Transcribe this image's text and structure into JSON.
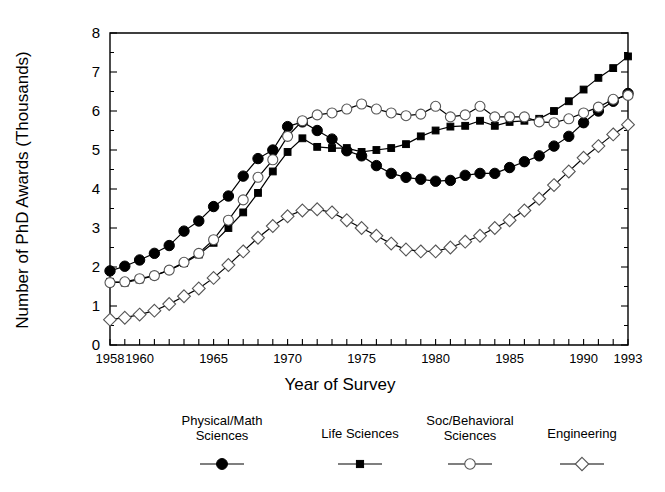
{
  "chart_data": {
    "type": "line",
    "title": "",
    "xlabel": "Year of Survey",
    "ylabel": "Number of PhD Awards (Thousands)",
    "xlim": [
      1958,
      1993
    ],
    "ylim": [
      0,
      8
    ],
    "ytick_labels": [
      "0",
      "1",
      "2",
      "3",
      "4",
      "5",
      "6",
      "7",
      "8"
    ],
    "ytick_values": [
      0,
      1,
      2,
      3,
      4,
      5,
      6,
      7,
      8
    ],
    "xtick_labels": [
      "1958",
      "1960",
      "1965",
      "1970",
      "1975",
      "1980",
      "1985",
      "1990",
      "1993"
    ],
    "xtick_values": [
      1958,
      1960,
      1965,
      1970,
      1975,
      1980,
      1985,
      1990,
      1993
    ],
    "grid": false,
    "legend_position": "bottom",
    "x": [
      1958,
      1959,
      1960,
      1961,
      1962,
      1963,
      1964,
      1965,
      1966,
      1967,
      1968,
      1969,
      1970,
      1971,
      1972,
      1973,
      1974,
      1975,
      1976,
      1977,
      1978,
      1979,
      1980,
      1981,
      1982,
      1983,
      1984,
      1985,
      1986,
      1987,
      1988,
      1989,
      1990,
      1991,
      1992,
      1993
    ],
    "series": [
      {
        "name": "Physical/Math Sciences",
        "marker": "filled-circle",
        "values": [
          1.9,
          2.02,
          2.18,
          2.35,
          2.55,
          2.92,
          3.18,
          3.55,
          3.82,
          4.33,
          4.78,
          5.0,
          5.6,
          5.72,
          5.5,
          5.28,
          4.98,
          4.85,
          4.6,
          4.4,
          4.3,
          4.25,
          4.2,
          4.22,
          4.35,
          4.4,
          4.4,
          4.55,
          4.7,
          4.85,
          5.1,
          5.35,
          5.7,
          6.0,
          6.25,
          6.45
        ]
      },
      {
        "name": "Life Sciences",
        "marker": "filled-square",
        "values": [
          1.62,
          1.6,
          1.68,
          1.78,
          1.92,
          2.1,
          2.32,
          2.62,
          3.0,
          3.4,
          3.9,
          4.45,
          4.95,
          5.3,
          5.08,
          5.05,
          5.05,
          4.95,
          5.0,
          5.05,
          5.15,
          5.35,
          5.5,
          5.6,
          5.62,
          5.75,
          5.62,
          5.72,
          5.75,
          5.8,
          6.0,
          6.25,
          6.55,
          6.85,
          7.1,
          7.4
        ]
      },
      {
        "name": "Soc/Behavioral Sciences",
        "marker": "open-circle",
        "values": [
          1.6,
          1.62,
          1.7,
          1.78,
          1.92,
          2.12,
          2.35,
          2.7,
          3.2,
          3.72,
          4.3,
          4.75,
          5.35,
          5.75,
          5.9,
          5.95,
          6.05,
          6.18,
          6.05,
          5.95,
          5.88,
          5.92,
          6.12,
          5.85,
          5.9,
          6.12,
          5.85,
          5.85,
          5.85,
          5.72,
          5.7,
          5.8,
          5.95,
          6.1,
          6.3,
          6.4
        ]
      },
      {
        "name": "Engineering",
        "marker": "open-diamond",
        "values": [
          0.65,
          0.7,
          0.78,
          0.88,
          1.05,
          1.25,
          1.45,
          1.72,
          2.05,
          2.4,
          2.75,
          3.05,
          3.3,
          3.45,
          3.48,
          3.4,
          3.2,
          3.0,
          2.8,
          2.6,
          2.45,
          2.4,
          2.4,
          2.5,
          2.65,
          2.8,
          3.0,
          3.2,
          3.45,
          3.75,
          4.1,
          4.45,
          4.8,
          5.1,
          5.4,
          5.65
        ]
      }
    ]
  },
  "axis": {
    "ylabel": "Number of PhD Awards (Thousands)",
    "xlabel": "Year of Survey"
  },
  "legend": {
    "items": [
      {
        "label_line1": "Physical/Math",
        "label_line2": "Sciences",
        "marker": "filled-circle"
      },
      {
        "label_line1": "Life Sciences",
        "label_line2": "",
        "marker": "filled-square"
      },
      {
        "label_line1": "Soc/Behavioral",
        "label_line2": "Sciences",
        "marker": "open-circle"
      },
      {
        "label_line1": "Engineering",
        "label_line2": "",
        "marker": "open-diamond"
      }
    ]
  }
}
